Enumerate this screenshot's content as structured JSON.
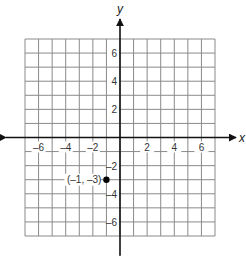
{
  "chart_data": {
    "type": "scatter",
    "title": "",
    "xlabel": "x",
    "ylabel": "y",
    "xlim": [
      -7,
      7
    ],
    "ylim": [
      -7,
      7
    ],
    "grid": true,
    "grid_step": 1,
    "x_ticks": [
      -6,
      -4,
      -2,
      2,
      4,
      6
    ],
    "y_ticks": [
      6,
      4,
      2,
      -2,
      -4,
      -6
    ],
    "x_tick_labels": [
      "–6",
      "–4",
      "–2",
      "2",
      "4",
      "6"
    ],
    "y_tick_labels": [
      "6",
      "4",
      "2",
      "–2",
      "–4",
      "–6"
    ],
    "points": [
      {
        "x": -1,
        "y": -3,
        "label": "(–1, –3)"
      }
    ],
    "legend": null
  },
  "colors": {
    "grid": "#8a8a8a",
    "axis": "#111111",
    "point": "#000000"
  }
}
